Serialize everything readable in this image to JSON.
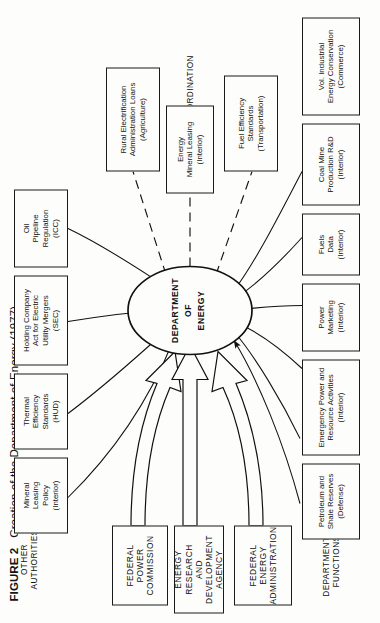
{
  "figure": {
    "number": "FIGURE 2",
    "caption": "Creation of the Department of Energy (1977)"
  },
  "center": {
    "line1": "DEPARTMENT",
    "line2": "OF",
    "line3": "ENERGY",
    "shape": "ellipse"
  },
  "sections": {
    "other_authorities": "OTHER\nAUTHORITIES",
    "departmental_functions": "DEPARTMENTAL\nFUNCTIONS",
    "coordination": "COORDINATION"
  },
  "agencies": [
    {
      "name": "federal-energy-administration",
      "line1": "FEDERAL",
      "line2": "ENERGY",
      "line3": "ADMINISTRATION"
    },
    {
      "name": "energy-research-and-development-agency",
      "line1": "ENERGY RESEARCH",
      "line2": "AND DEVELOPMENT",
      "line3": "AGENCY"
    },
    {
      "name": "federal-power-commission",
      "line1": "FEDERAL",
      "line2": "POWER",
      "line3": "COMMISSION"
    }
  ],
  "other_authorities": [
    {
      "name": "mineral-leasing-policy",
      "title": "Mineral\nLeasing\nPolicy",
      "dept": "(Interior)"
    },
    {
      "name": "thermal-efficiency-standards",
      "title": "Thermal\nEfficiency\nStandards",
      "dept": "(HUD)"
    },
    {
      "name": "holding-company-act",
      "title": "Holding Company\nAct for Electric\nUtility Mergers",
      "dept": "(SEC)"
    },
    {
      "name": "oil-pipeline-regulation",
      "title": "Oil\nPipeline\nRegulation",
      "dept": "(ICC)"
    }
  ],
  "departmental_functions": [
    {
      "name": "petroleum-and-shale-reserves",
      "title": "Petroleum and\nShale Reserves",
      "dept": "(Defense)"
    },
    {
      "name": "emergency-power-and-resource-activities",
      "title": "Emergency Power and\nResource Activities",
      "dept": "(Interior)"
    },
    {
      "name": "power-marketing",
      "title": "Power\nMarketing",
      "dept": "(Interior)"
    },
    {
      "name": "fuels-data",
      "title": "Fuels\nData",
      "dept": "(Interior)"
    },
    {
      "name": "coal-mine-production-rd",
      "title": "Coal Mine\nProduction R&D",
      "dept": "(Interior)"
    },
    {
      "name": "vol-industrial-energy-conservation",
      "title": "Vol. Industrial\nEnergy Conservation",
      "dept": "(Commerce)"
    }
  ],
  "coordination": [
    {
      "name": "rural-electrification-administration-loans",
      "title": "Rural Electrification\nAdministration Loans",
      "dept": "(Agriculture)"
    },
    {
      "name": "energy-mineral-leasing",
      "title": "Energy\nMineral Leasing",
      "dept": "(Interior)"
    },
    {
      "name": "fuel-efficiency-standards",
      "title": "Fuel Efficiency\nStandards",
      "dept": "(Transportation)"
    }
  ],
  "colors": {
    "ink": "#1a1a1a",
    "paper": "#fdfdfb"
  }
}
